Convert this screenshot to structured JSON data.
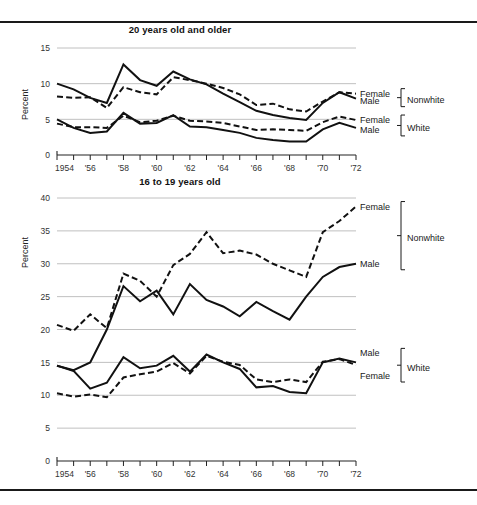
{
  "figure": {
    "background": "#ffffff",
    "line_color": "#111111",
    "grid_color": "#b9b9b9",
    "axis_color": "#222222"
  },
  "panels": [
    {
      "id": "panel-20-and-older",
      "title": "20 years old and older",
      "ylabel": "Percent",
      "yticks": [
        "0",
        "5",
        "10",
        "15"
      ],
      "legend": [
        {
          "label": "Female",
          "group": "Nonwhite"
        },
        {
          "label": "Male",
          "group": "Nonwhite"
        },
        {
          "label": "Female",
          "group": "White"
        },
        {
          "label": "Male",
          "group": "White"
        }
      ],
      "group_labels": [
        "Nonwhite",
        "White"
      ]
    },
    {
      "id": "panel-16-to-19",
      "title": "16 to 19 years old",
      "ylabel": "Percent",
      "yticks": [
        "0",
        "5",
        "10",
        "15",
        "20",
        "25",
        "30",
        "35",
        "40"
      ],
      "legend": [
        {
          "label": "Female",
          "group": "Nonwhite"
        },
        {
          "label": "Male",
          "group": "Nonwhite"
        },
        {
          "label": "Male",
          "group": "White"
        },
        {
          "label": "Female",
          "group": "White"
        }
      ],
      "group_labels": [
        "Nonwhite",
        "White"
      ]
    }
  ],
  "xaxis": {
    "tick_labels": [
      "1954",
      "'56",
      "'58",
      "'60",
      "'62",
      "'64",
      "'66",
      "'68",
      "'70",
      "'72"
    ],
    "tick_years": [
      1954,
      1956,
      1958,
      1960,
      1962,
      1964,
      1966,
      1968,
      1970,
      1972
    ],
    "minor_every_year": true,
    "range": [
      1954,
      1972
    ]
  },
  "chart_data": [
    {
      "type": "line",
      "title": "20 years old and older",
      "xlabel": "",
      "ylabel": "Percent",
      "xlim": [
        1954,
        1972
      ],
      "ylim": [
        0,
        15
      ],
      "grid": true,
      "legend_position": "right",
      "x": [
        1954,
        1955,
        1956,
        1957,
        1958,
        1959,
        1960,
        1961,
        1962,
        1963,
        1964,
        1965,
        1966,
        1967,
        1968,
        1969,
        1970,
        1971,
        1972
      ],
      "series": [
        {
          "name": "Nonwhite Male",
          "style": "solid",
          "values": [
            10.0,
            9.2,
            8.0,
            7.3,
            12.7,
            10.5,
            9.7,
            11.7,
            10.6,
            9.9,
            8.6,
            7.4,
            6.2,
            5.6,
            5.2,
            4.9,
            7.3,
            8.8,
            7.9
          ]
        },
        {
          "name": "Nonwhite Female",
          "style": "dashed",
          "values": [
            8.2,
            8.0,
            8.1,
            6.6,
            9.5,
            8.8,
            8.5,
            10.9,
            10.5,
            10.0,
            9.4,
            8.5,
            7.0,
            7.2,
            6.4,
            6.1,
            7.5,
            8.8,
            8.6
          ]
        },
        {
          "name": "White Male",
          "style": "solid",
          "values": [
            5.0,
            3.8,
            3.1,
            3.3,
            5.9,
            4.4,
            4.5,
            5.6,
            4.0,
            3.9,
            3.5,
            3.1,
            2.4,
            2.1,
            1.9,
            1.9,
            3.6,
            4.5,
            3.8
          ]
        },
        {
          "name": "White Female",
          "style": "dashed",
          "values": [
            4.4,
            3.9,
            3.9,
            3.8,
            5.5,
            4.6,
            4.8,
            5.5,
            4.8,
            4.7,
            4.5,
            4.0,
            3.5,
            3.6,
            3.5,
            3.4,
            4.6,
            5.4,
            4.9
          ]
        }
      ]
    },
    {
      "type": "line",
      "title": "16 to 19 years old",
      "xlabel": "",
      "ylabel": "Percent",
      "xlim": [
        1954,
        1972
      ],
      "ylim": [
        0,
        40
      ],
      "grid": true,
      "legend_position": "right",
      "x": [
        1954,
        1955,
        1956,
        1957,
        1958,
        1959,
        1960,
        1961,
        1962,
        1963,
        1964,
        1965,
        1966,
        1967,
        1968,
        1969,
        1970,
        1971,
        1972
      ],
      "series": [
        {
          "name": "Nonwhite Female",
          "style": "dashed",
          "values": [
            20.7,
            19.8,
            22.3,
            20.2,
            28.5,
            27.4,
            25.0,
            29.8,
            31.5,
            34.8,
            31.6,
            32.0,
            31.4,
            30.0,
            29.0,
            28.0,
            34.8,
            36.5,
            38.7
          ]
        },
        {
          "name": "Nonwhite Male",
          "style": "solid",
          "values": [
            14.5,
            13.8,
            15.0,
            20.0,
            26.6,
            24.3,
            25.9,
            22.3,
            26.9,
            24.5,
            23.5,
            22.0,
            24.2,
            22.8,
            21.5,
            25.0,
            28.0,
            29.5,
            30.0
          ]
        },
        {
          "name": "White Male",
          "style": "solid",
          "values": [
            14.5,
            13.7,
            11.0,
            11.9,
            15.8,
            14.1,
            14.5,
            16.0,
            13.6,
            16.2,
            15.0,
            14.0,
            11.2,
            11.4,
            10.5,
            10.3,
            15.0,
            15.6,
            15.0
          ]
        },
        {
          "name": "White Female",
          "style": "dashed",
          "values": [
            10.3,
            9.8,
            10.1,
            9.7,
            12.7,
            13.2,
            13.6,
            14.9,
            13.3,
            16.0,
            15.1,
            14.6,
            12.4,
            12.0,
            12.4,
            12.0,
            15.1,
            15.5,
            14.6
          ]
        }
      ]
    }
  ]
}
